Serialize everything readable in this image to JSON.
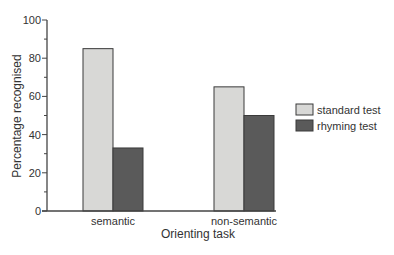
{
  "chart_data": {
    "type": "bar",
    "title": "",
    "xlabel": "Orienting task",
    "ylabel": "Percentage recognised",
    "ylim": [
      0,
      100
    ],
    "yticks": [
      0,
      20,
      40,
      60,
      80,
      100
    ],
    "categories": [
      "semantic",
      "non-semantic"
    ],
    "series": [
      {
        "name": "standard test",
        "values": [
          85,
          65
        ],
        "color": "#d8d8d6"
      },
      {
        "name": "rhyming test",
        "values": [
          33,
          50
        ],
        "color": "#5a5a5a"
      }
    ],
    "legend_position": "right",
    "grid": false
  }
}
